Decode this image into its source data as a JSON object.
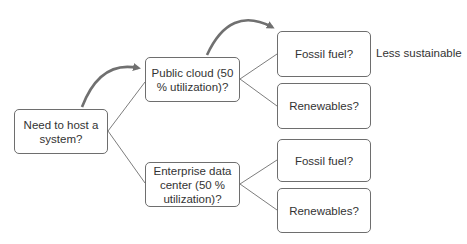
{
  "diagram": {
    "type": "decision-tree",
    "root": {
      "label": "Need to host a system?"
    },
    "level1": [
      {
        "label": "Public cloud (50 % utilization)?"
      },
      {
        "label": "Enterprise data center (50 % utilization)?"
      }
    ],
    "level2": [
      {
        "parent": 0,
        "label": "Fossil fuel?"
      },
      {
        "parent": 0,
        "label": "Renewables?"
      },
      {
        "parent": 1,
        "label": "Fossil fuel?"
      },
      {
        "parent": 1,
        "label": "Renewables?"
      }
    ],
    "annotation": {
      "label": "Less sustainable"
    },
    "colors": {
      "line": "#6e6e6e",
      "arrow": "#707070",
      "text": "#333333",
      "background": "#ffffff"
    }
  }
}
